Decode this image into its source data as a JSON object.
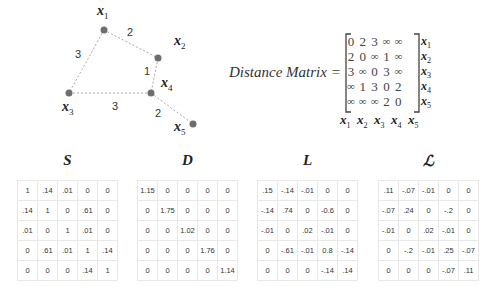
{
  "graph": {
    "nodes": [
      {
        "id": "x1",
        "label": "x",
        "sub": "1",
        "cx": 104,
        "cy": 30
      },
      {
        "id": "x2",
        "label": "x",
        "sub": "2",
        "cx": 158,
        "cy": 58
      },
      {
        "id": "x3",
        "label": "x",
        "sub": "3",
        "cx": 69,
        "cy": 93
      },
      {
        "id": "x4",
        "label": "x",
        "sub": "4",
        "cx": 151,
        "cy": 93
      },
      {
        "id": "x5",
        "label": "x",
        "sub": "5",
        "cx": 193,
        "cy": 124
      }
    ],
    "edges": [
      {
        "from": "x1",
        "to": "x2",
        "weight": "2"
      },
      {
        "from": "x1",
        "to": "x3",
        "weight": "3"
      },
      {
        "from": "x2",
        "to": "x4",
        "weight": "1"
      },
      {
        "from": "x3",
        "to": "x4",
        "weight": "3"
      },
      {
        "from": "x4",
        "to": "x5",
        "weight": "2"
      }
    ],
    "node_color": "#6e6e6e",
    "edge_color": "#aaaaaa"
  },
  "distance_matrix": {
    "title": "Distance Matrix =",
    "rows": [
      [
        "0",
        "2",
        "3",
        "∞",
        "∞"
      ],
      [
        "2",
        "0",
        "∞",
        "1",
        "∞"
      ],
      [
        "3",
        "∞",
        "0",
        "3",
        "∞"
      ],
      [
        "∞",
        "1",
        "3",
        "0",
        "2"
      ],
      [
        "∞",
        "∞",
        "∞",
        "2",
        "0"
      ]
    ],
    "row_labels": [
      "1",
      "2",
      "3",
      "4",
      "5"
    ],
    "col_labels": [
      "1",
      "2",
      "3",
      "4",
      "5"
    ],
    "var": "x"
  },
  "matrices": [
    {
      "title": "S",
      "rows": [
        [
          "1",
          ".14",
          ".01",
          "0",
          "0"
        ],
        [
          ".14",
          "1",
          "0",
          ".61",
          "0"
        ],
        [
          ".01",
          "0",
          "1",
          ".01",
          "0"
        ],
        [
          "0",
          ".61",
          ".01",
          "1",
          ".14"
        ],
        [
          "0",
          "0",
          "0",
          ".14",
          "1"
        ]
      ]
    },
    {
      "title": "D",
      "rows": [
        [
          "1.15",
          "0",
          "0",
          "0",
          "0"
        ],
        [
          "0",
          "1.75",
          "0",
          "0",
          "0"
        ],
        [
          "0",
          "0",
          "1.02",
          "0",
          "0"
        ],
        [
          "0",
          "0",
          "0",
          "1.76",
          "0"
        ],
        [
          "0",
          "0",
          "0",
          "0",
          "1.14"
        ]
      ]
    },
    {
      "title": "L",
      "rows": [
        [
          ".15",
          "-.14",
          "-.01",
          "0",
          "0"
        ],
        [
          "-.14",
          ".74",
          "0",
          "-0.6",
          "0"
        ],
        [
          "-.01",
          "0",
          ".02",
          "-.01",
          "0"
        ],
        [
          "0",
          "-.61",
          "-.01",
          "0.8",
          "-.14"
        ],
        [
          "0",
          "0",
          "0",
          "-.14",
          ".14"
        ]
      ]
    },
    {
      "title": "ℒ",
      "rows": [
        [
          ".11",
          "-.07",
          "-.01",
          "0",
          "0"
        ],
        [
          "-.07",
          ".24",
          "0",
          "-.2",
          "0"
        ],
        [
          "-.01",
          "0",
          ".02",
          "-.01",
          "0"
        ],
        [
          "0",
          "-.2",
          "-.01",
          ".25",
          "-.07"
        ],
        [
          "0",
          "0",
          "0",
          "-.07",
          ".11"
        ]
      ]
    }
  ]
}
